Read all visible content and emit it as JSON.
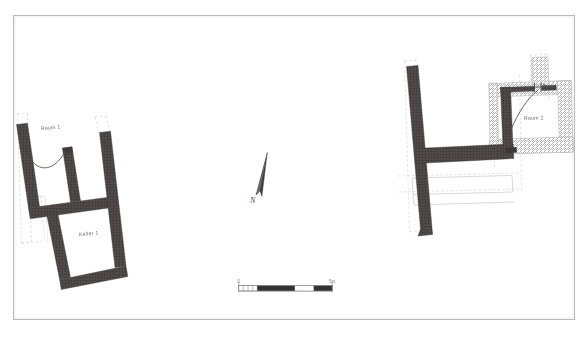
{
  "document": {
    "type": "archaeological-site-plan",
    "background_color": "#ffffff",
    "frame_color": "#b5b5b5",
    "wall_fill_color": "#4a4543",
    "hatch_color": "#9a9a9a",
    "construction_line_color": "#c9c9c9",
    "label_color": "#6e6e6e"
  },
  "frame": {
    "x": 13,
    "y": 15,
    "width": 562,
    "height": 305
  },
  "labels": {
    "room_1": "Raum 1",
    "cellar_1": "Keller 1",
    "room_2": "Raum 2"
  },
  "north_arrow": {
    "label": "N",
    "rotation_degrees": 12
  },
  "scale_bar": {
    "start_label": "0",
    "end_label": "5m",
    "total_units": 5,
    "segments": 4,
    "segment_fills": [
      "light",
      "dark",
      "light",
      "dark"
    ]
  },
  "structures": [
    {
      "id": "building-west",
      "name": "Western building",
      "rooms": [
        "Raum 1",
        "Keller 1"
      ],
      "wall_style": "solid-fill"
    },
    {
      "id": "building-east",
      "name": "Eastern building",
      "rooms": [
        "Raum 2"
      ],
      "wall_style": "solid-fill-and-hatched"
    }
  ]
}
